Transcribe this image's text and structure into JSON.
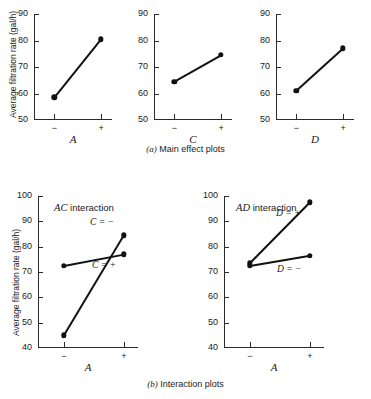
{
  "figure": {
    "captions": {
      "a_prefix": "(a)",
      "a_text": "Main effect plots",
      "b_prefix": "(b)",
      "b_text": "Interaction plots"
    },
    "y_axis_label": "Average filtration rate (gal/h)",
    "level_low": "−",
    "level_high": "+"
  },
  "chart_data": [
    {
      "type": "line",
      "title": "Main effect of A",
      "xlabel": "A",
      "ylabel": "Average filtration rate (gal/h)",
      "categories": [
        "−",
        "+"
      ],
      "values": [
        58.5,
        80.5
      ],
      "ylim": [
        50,
        90
      ],
      "yticks": [
        50,
        60,
        70,
        80,
        90
      ],
      "grid": false,
      "legend": "none"
    },
    {
      "type": "line",
      "title": "Main effect of C",
      "xlabel": "C",
      "ylabel": "",
      "categories": [
        "−",
        "+"
      ],
      "values": [
        64.5,
        74.5
      ],
      "ylim": [
        50,
        90
      ],
      "yticks": [
        50,
        60,
        70,
        80,
        90
      ],
      "grid": false,
      "legend": "none"
    },
    {
      "type": "line",
      "title": "Main effect of D",
      "xlabel": "D",
      "ylabel": "",
      "categories": [
        "−",
        "+"
      ],
      "values": [
        61.0,
        77.0
      ],
      "ylim": [
        50,
        90
      ],
      "yticks": [
        50,
        60,
        70,
        80,
        90
      ],
      "grid": false,
      "legend": "none"
    },
    {
      "type": "line",
      "title": "AC interaction",
      "xlabel": "A",
      "ylabel": "Average filtration rate (gal/h)",
      "categories": [
        "−",
        "+"
      ],
      "ylim": [
        40,
        100
      ],
      "yticks": [
        40,
        50,
        60,
        70,
        80,
        90,
        100
      ],
      "grid": false,
      "legend": "inline-right",
      "series": [
        {
          "name": "C = −",
          "values": [
            45.0,
            84.5
          ]
        },
        {
          "name": "C = +",
          "values": [
            72.5,
            77.0
          ]
        }
      ]
    },
    {
      "type": "line",
      "title": "AD interaction",
      "xlabel": "A",
      "ylabel": "",
      "categories": [
        "−",
        "+"
      ],
      "ylim": [
        40,
        100
      ],
      "yticks": [
        40,
        50,
        60,
        70,
        80,
        90,
        100
      ],
      "grid": false,
      "legend": "inline-right",
      "series": [
        {
          "name": "D = +",
          "values": [
            73.5,
            97.5
          ]
        },
        {
          "name": "D = −",
          "values": [
            72.5,
            76.5
          ]
        }
      ]
    }
  ]
}
